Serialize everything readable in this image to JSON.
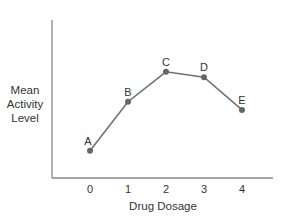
{
  "chart_data": {
    "type": "line",
    "title": "",
    "xlabel": "Drug Dosage",
    "ylabel": "Mean Activity Level",
    "ylabel_lines": [
      "Mean",
      "Activity",
      "Level"
    ],
    "categories": [
      "0",
      "1",
      "2",
      "3",
      "4"
    ],
    "x": [
      0,
      1,
      2,
      3,
      4
    ],
    "point_labels": [
      "A",
      "B",
      "C",
      "D",
      "E"
    ],
    "values": [
      1.0,
      2.8,
      3.9,
      3.7,
      2.5
    ],
    "y_ticks_shown": false,
    "ylim": [
      0,
      5.8
    ],
    "grid": false,
    "legend": "none",
    "colors": {
      "line": "#707070",
      "marker": "#666666",
      "axis": "#888888",
      "text": "#333333"
    }
  }
}
